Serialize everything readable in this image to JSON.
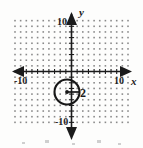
{
  "figure": {
    "title": "",
    "background_color": "#fdfdfc",
    "ink_color": "#1b1b1b",
    "grid_dot_color": "#8a8a8a"
  },
  "axes": {
    "x_axis_label": "x",
    "y_axis_label": "y",
    "x_min_label": "-10",
    "x_max_label": "10",
    "y_max_label": "10",
    "y_min_label": "-10",
    "x_range": [
      -10,
      10
    ],
    "y_range": [
      -10,
      10
    ],
    "tick_step": 1,
    "grid": "dotted",
    "arrowheads": "both-ends-both-axes"
  },
  "chart_data": {
    "type": "scatter",
    "title": "",
    "xlabel": "x",
    "ylabel": "y",
    "xlim": [
      -10,
      10
    ],
    "ylim": [
      -10,
      10
    ],
    "grid": true,
    "grid_style": "dotted-lattice",
    "legend": "none",
    "annotations": [
      {
        "name": "radius-label",
        "text": "2",
        "x": 1.6,
        "y": -2.8
      }
    ],
    "shapes": [
      {
        "name": "circle",
        "type": "circle",
        "center": [
          -0.7,
          -2.8
        ],
        "radius": 1.7,
        "radius_label": "2",
        "center_marked": true,
        "radius_segment": "center-to-right"
      }
    ],
    "series": [
      {
        "name": "circle-center",
        "type": "point",
        "x": [
          -0.7
        ],
        "y": [
          -2.8
        ]
      }
    ]
  },
  "artifacts": {
    "scan_marks_bottom": "faint scanner specks along lower edge"
  }
}
